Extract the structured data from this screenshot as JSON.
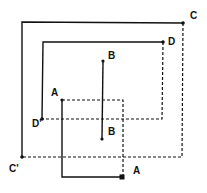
{
  "diagram": {
    "type": "nested-square-projections",
    "labels": {
      "C": "C",
      "C_prime": "C'",
      "D": "D",
      "D_prime": "D'",
      "B_top": "B",
      "B_bottom": "B",
      "A_top": "A",
      "A_bottom": "A"
    },
    "colors": {
      "stroke": "#111111",
      "background": "#ffffff"
    },
    "shapes": [
      {
        "name": "square-C",
        "solid_corner": "C'",
        "dashed_corner": "C",
        "points": {
          "top_left": [
            22,
            22
          ],
          "top_right": [
            183,
            23
          ],
          "bottom_left": [
            22,
            157
          ],
          "bottom_right": [
            182,
            157
          ]
        }
      },
      {
        "name": "square-D",
        "solid_corner": "D'",
        "dashed_corner": "D",
        "points": {
          "top_left": [
            43,
            42
          ],
          "top_right": [
            163,
            42
          ],
          "bottom_left": [
            42,
            119
          ],
          "bottom_right": [
            162,
            119
          ]
        }
      },
      {
        "name": "segment-B",
        "points": {
          "top": [
            103,
            61
          ],
          "bottom": [
            102,
            139
          ]
        }
      },
      {
        "name": "square-A",
        "points": {
          "top_left": [
            62,
            100
          ],
          "top_right": [
            123,
            100
          ],
          "bottom_left": [
            62,
            177
          ],
          "bottom_right": [
            122,
            177
          ]
        }
      }
    ]
  }
}
